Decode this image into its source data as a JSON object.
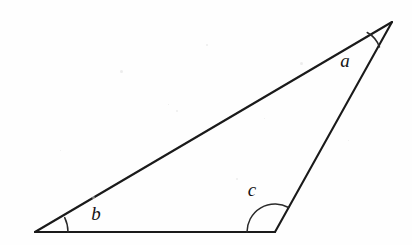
{
  "figure": {
    "type": "geometry-diagram",
    "shape": "triangle",
    "background_color": "#fefefe",
    "ink_color": "#1a1a1a",
    "stroke_width": 2.1,
    "canvas": {
      "width": 412,
      "height": 245
    },
    "vertices": [
      {
        "id": "apex",
        "label": "a",
        "x": 392,
        "y": 22
      },
      {
        "id": "left",
        "label": "b",
        "x": 35,
        "y": 232
      },
      {
        "id": "right",
        "label": "c",
        "x": 275,
        "y": 232
      }
    ],
    "edges": [
      {
        "id": "base",
        "from": "left",
        "to": "right",
        "path": "M 35 232 L 275 232"
      },
      {
        "id": "right-leg",
        "from": "right",
        "to": "apex",
        "path": "M 275 232 L 392 22"
      },
      {
        "id": "hypotenuse",
        "from": "apex",
        "to": "left",
        "path": "M 392 22 L 35 232"
      }
    ],
    "angles": [
      {
        "id": "angle-a",
        "label": "a",
        "vertex": "apex",
        "degrees": 21,
        "arc_radius": 27,
        "arc_path": "M 367.2 32.5 A 27 27 0 0 1 379.5 46.9",
        "label_x": 345,
        "label_y": 63
      },
      {
        "id": "angle-b",
        "label": "b",
        "vertex": "left",
        "degrees": 26,
        "arc_radius": 33,
        "arc_path": "M 68 232 A 33 33 0 0 0 64.7 217.6",
        "label_x": 96,
        "label_y": 216
      },
      {
        "id": "angle-c",
        "label": "c",
        "vertex": "right",
        "degrees": 119,
        "arc_radius": 28,
        "arc_path": "M 247 232 A 28 28 0 0 1 288.6 207.5",
        "label_x": 252,
        "label_y": 192
      }
    ],
    "labels": {
      "a": "a",
      "b": "b",
      "c": "c"
    }
  }
}
